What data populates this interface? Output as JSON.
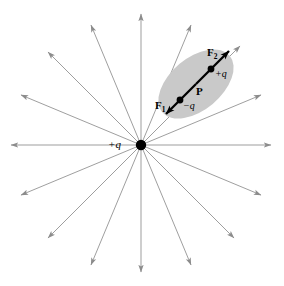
{
  "figure": {
    "background_color": "#ffffff",
    "width": 284,
    "height": 286
  },
  "field": {
    "source_charge_label": "+q",
    "source_charge_x": 141,
    "source_charge_y": 145,
    "line_color": "#8c8c8c",
    "line_count": 16,
    "dot_color": "#000000",
    "angles_deg": [
      0,
      22.5,
      45,
      67.5,
      90,
      112.5,
      135,
      157.5,
      180,
      202.5,
      225,
      247.5,
      270,
      292.5,
      315,
      337.5
    ]
  },
  "dipole": {
    "ellipse_fill": "#c9c9c9",
    "ellipse_center_x": 196,
    "ellipse_center_y": 84,
    "ellipse_rx": 44,
    "ellipse_ry": 26,
    "ellipse_rotation_deg": -40,
    "axis_color": "#000000",
    "negative_charge_label": "−q",
    "positive_charge_label": "+q",
    "moment_label": "P",
    "force_near_label": "F",
    "force_near_sub": "1",
    "force_far_label": "F",
    "force_far_sub": "2"
  },
  "labels": {
    "center_charge": "+q",
    "force_1": "F",
    "force_1_sub": "1",
    "force_2": "F",
    "force_2_sub": "2",
    "neg_charge": "−q",
    "pos_charge": "+q",
    "dipole_moment": "P"
  }
}
